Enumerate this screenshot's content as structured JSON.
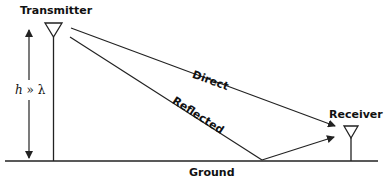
{
  "diagram": {
    "type": "two-ray propagation",
    "labels": {
      "transmitter": "Transmitter",
      "receiver": "Receiver",
      "direct": "Direct",
      "reflected": "Reflected",
      "ground": "Ground",
      "height_var": "h",
      "height_rel": "»",
      "wavelength": "λ"
    },
    "colors": {
      "line": "#222222",
      "background": "#ffffff"
    }
  }
}
